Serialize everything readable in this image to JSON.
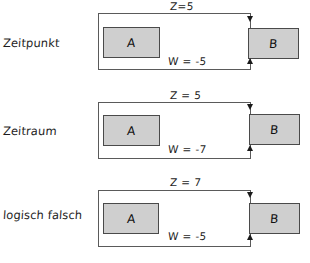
{
  "diagram": {
    "style": "hand-drawn",
    "box_fill_color": "#cfcfcf",
    "line_color": "#5a5a5a",
    "background_color": "#ffffff",
    "rows": [
      {
        "caption": "Zeitpunkt",
        "z_label": "Z=5",
        "w_label": "W = -5",
        "box_a_label": "A",
        "box_b_label": "B"
      },
      {
        "caption": "Zeitraum",
        "z_label": "Z = 5",
        "w_label": "W = -7",
        "box_a_label": "A",
        "box_b_label": "B"
      },
      {
        "caption": "logisch falsch",
        "z_label": "Z = 7",
        "w_label": "W = -5",
        "box_a_label": "A",
        "box_b_label": "B"
      }
    ]
  }
}
